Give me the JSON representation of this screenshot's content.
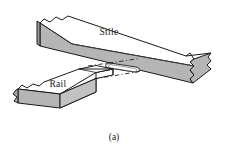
{
  "figure": {
    "caption": "(a)",
    "type": "isometric-technical-drawing",
    "labels": {
      "stile": "Stile",
      "rail": "Rail"
    },
    "parts": [
      {
        "name": "stile",
        "label": "Stile",
        "description": "long horizontal beam running diagonally upper-left to lower-right, broken at both ends",
        "top_face_color": "#ffffff",
        "front_face_color": "#b5b5b5",
        "end_face_color": "#9a9a9a"
      },
      {
        "name": "rail",
        "label": "Rail",
        "description": "short block at lower left with a tenon projecting right toward the stile",
        "top_face_color": "#ffffff",
        "front_face_color": "#b5b5b5",
        "end_face_color": "#a8a8a8"
      },
      {
        "name": "tenon",
        "label": "",
        "description": "white unshaded rectangular projection on right end of rail",
        "face_color": "#ffffff"
      },
      {
        "name": "mortise",
        "label": "",
        "description": "rounded rectangular slot cut into the front face of the stile",
        "face_color": "#ffffff"
      },
      {
        "name": "alignment-lines",
        "label": "",
        "description": "dashed center lines connecting tenon to mortise"
      }
    ],
    "colors": {
      "outline": "#1a1a1a",
      "shade_light": "#ffffff",
      "shade_mid": "#b5b5b5",
      "shade_dark": "#9a9a9a",
      "background": "#ffffff"
    }
  }
}
